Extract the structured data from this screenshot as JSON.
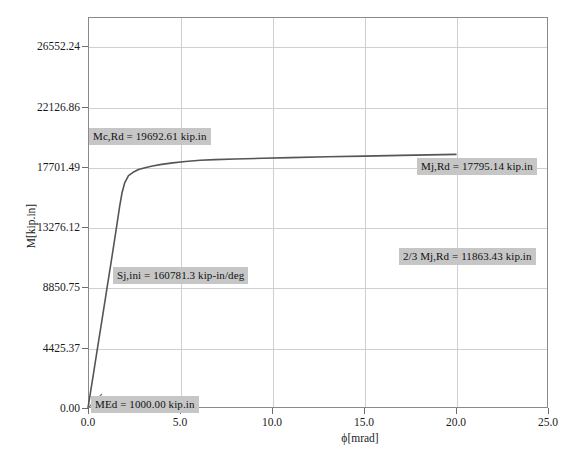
{
  "chart_data": {
    "type": "line",
    "title": "",
    "xlabel": "ϕ[mrad]",
    "ylabel": "M[kip.in]",
    "xlim": [
      0.0,
      25.0
    ],
    "ylim": [
      0.0,
      28700.0
    ],
    "grid": true,
    "legend": "none",
    "x_ticks": [
      "0.0",
      "5.0",
      "10.0",
      "15.0",
      "20.0",
      "25.0"
    ],
    "x_tick_values": [
      0.0,
      5.0,
      10.0,
      15.0,
      20.0,
      25.0
    ],
    "y_ticks": [
      "0.00",
      "4425.37",
      "8850.75",
      "13276.12",
      "17701.49",
      "22126.86",
      "26552.24"
    ],
    "y_tick_values": [
      0.0,
      4425.37,
      8850.75,
      13276.12,
      17701.49,
      22126.86,
      26552.24
    ],
    "series": [
      {
        "name": "Moment-rotation curve",
        "color": "#555555",
        "x": [
          0.0,
          0.12,
          0.3,
          0.55,
          0.8,
          1.05,
          1.25,
          1.4,
          1.52,
          1.62,
          1.72,
          1.85,
          2.0,
          2.2,
          2.45,
          2.75,
          3.1,
          3.5,
          4.0,
          4.6,
          5.3,
          6.1,
          6.9,
          8.0,
          9.5,
          11.0,
          13.0,
          15.0,
          17.0,
          18.5,
          20.0
        ],
        "y": [
          0.0,
          1020.0,
          2550.0,
          4680.0,
          6800.0,
          8950.0,
          10650.0,
          11950.0,
          13000.0,
          13900.0,
          14800.0,
          15800.0,
          16550.0,
          17050.0,
          17300.0,
          17500.0,
          17640.0,
          17760.0,
          17880.0,
          17990.0,
          18090.0,
          18180.0,
          18230.0,
          18280.0,
          18330.0,
          18380.0,
          18440.0,
          18490.0,
          18540.0,
          18580.0,
          18620.0
        ]
      }
    ],
    "annotations": [
      {
        "id": "mc-rd",
        "text": "Mc,Rd = 19692.61  kip.in",
        "value": 19692.61,
        "unit": "kip.in",
        "x_px": 89,
        "y_px": 128
      },
      {
        "id": "mj-rd",
        "text": "Mj,Rd = 17795.14 kip.in",
        "value": 17795.14,
        "unit": "kip.in",
        "x_px": 417,
        "y_px": 158
      },
      {
        "id": "two-thirds-mj-rd",
        "text": "2/3 Mj,Rd = 11863.43 kip.in",
        "value": 11863.43,
        "unit": "kip.in",
        "x_px": 399,
        "y_px": 248
      },
      {
        "id": "sj-ini",
        "text": "Sj,ini = 160781.3 kip-in/deg",
        "value": 160781.3,
        "unit": "kip-in/deg",
        "x_px": 113,
        "y_px": 267
      },
      {
        "id": "med",
        "text": "MEd = 1000.00 kip.in",
        "value": 1000.0,
        "unit": "kip.in",
        "x_px": 91,
        "y_px": 396
      }
    ]
  },
  "caption": {
    "text": ""
  }
}
